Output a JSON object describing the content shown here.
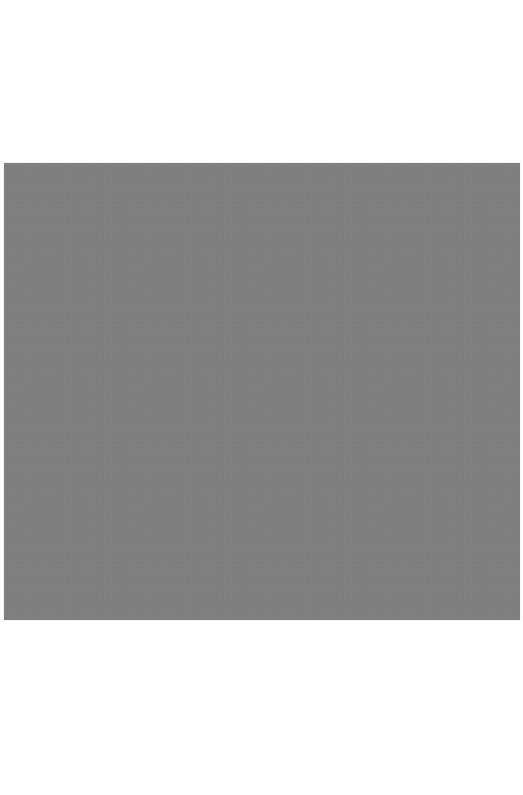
{
  "canvas": {
    "width": 523,
    "height": 795,
    "background_color": "#ffffff"
  },
  "panel": {
    "description": "Uniform mid-grey rectangle with no visible text or content",
    "color": "#7f7f7f",
    "region": {
      "x": 4,
      "y": 163,
      "width": 516,
      "height": 457
    }
  }
}
